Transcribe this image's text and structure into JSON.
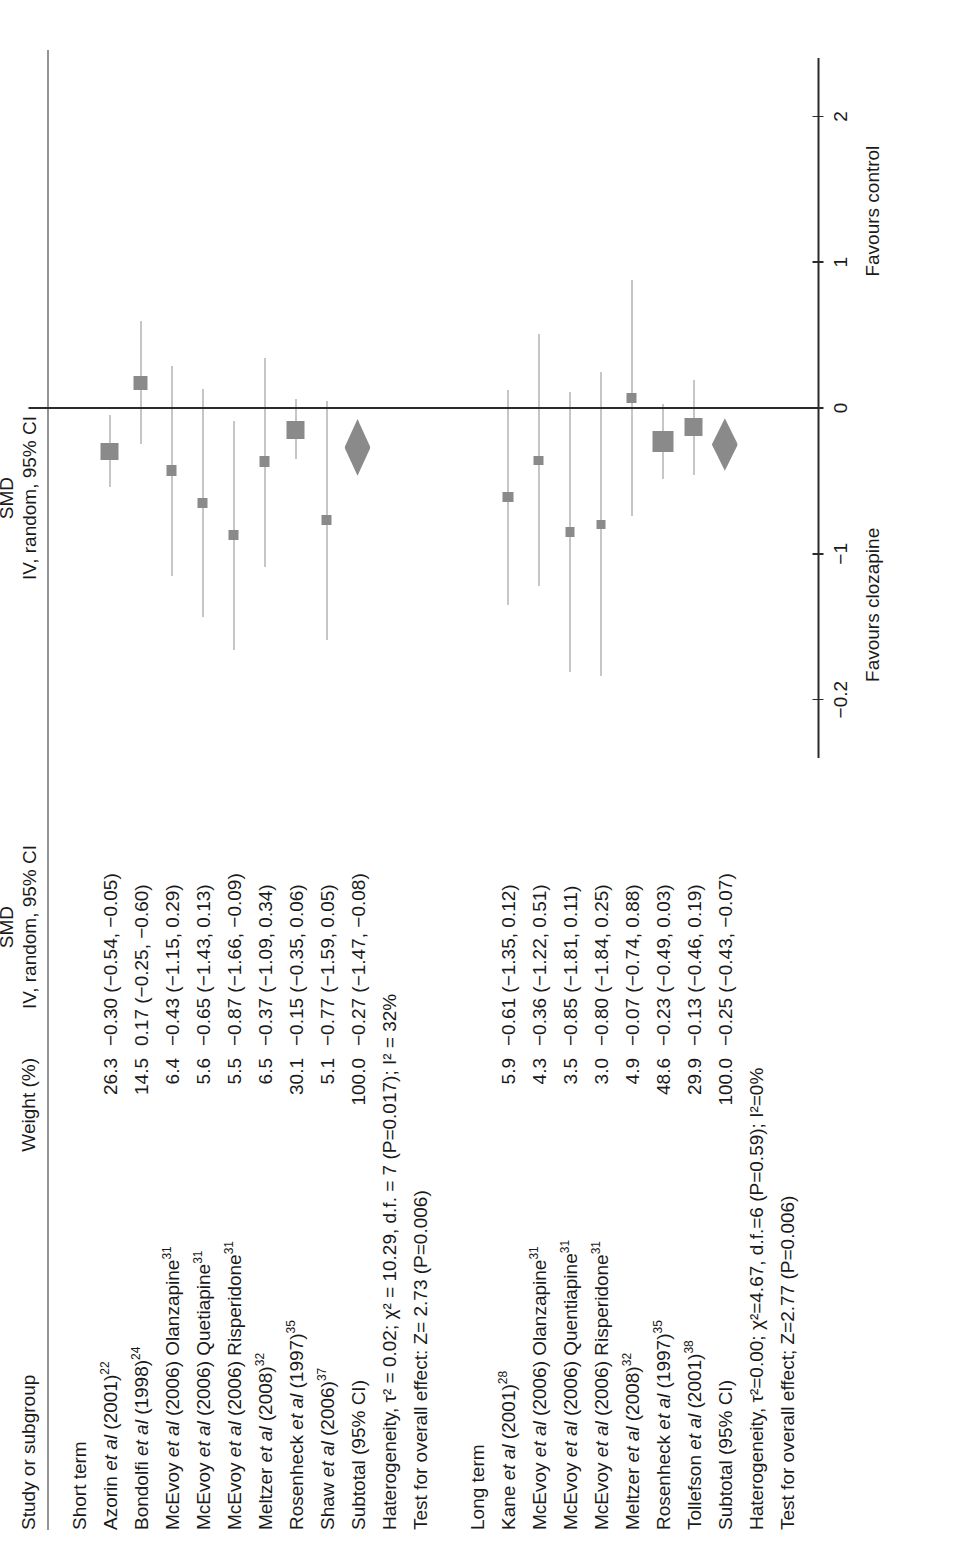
{
  "figure": {
    "columns": {
      "study": "Study or subgroup",
      "weight": "Weight (%)",
      "smd_line1": "SMD",
      "smd_line2": "IV, random, 95% CI",
      "plot_line1": "SMD",
      "plot_line2": "IV, random, 95% CI"
    },
    "axis": {
      "ticks": [
        "-0.2",
        "-1",
        "0",
        "1",
        "2"
      ],
      "tick_values": [
        -2,
        -1,
        0,
        1,
        2
      ],
      "favours_left": "Favours clozapine",
      "favours_right": "Favours control",
      "xmin": -2.4,
      "xmax": 2.4
    },
    "groups": [
      {
        "label": "Short term",
        "rows": [
          {
            "study": "Azorin",
            "study_rest": "et al",
            "year": " (2001)",
            "ref": "22",
            "weight": "26.3",
            "smd": "-0.30 (-0.54, -0.05)",
            "est": -0.3,
            "lo": -0.54,
            "hi": -0.05,
            "wt": 26.3,
            "type": "study"
          },
          {
            "study": "Bondolfi",
            "study_rest": "et al",
            "year": " (1998)",
            "ref": "24",
            "weight": "14.5",
            "smd": "0.17 (-0.25, -0.60)",
            "est": 0.17,
            "lo": -0.25,
            "hi": 0.6,
            "wt": 14.5,
            "type": "study"
          },
          {
            "study": "McEvoy",
            "study_rest": "et al",
            "year": " (2006) Olanzapine",
            "ref": "31",
            "weight": "6.4",
            "smd": "-0.43 (-1.15, 0.29)",
            "est": -0.43,
            "lo": -1.15,
            "hi": 0.29,
            "wt": 6.4,
            "type": "study"
          },
          {
            "study": "McEvoy",
            "study_rest": "et al",
            "year": " (2006) Quetiapine",
            "ref": "31",
            "weight": "5.6",
            "smd": "-0.65 (-1.43, 0.13)",
            "est": -0.65,
            "lo": -1.43,
            "hi": 0.13,
            "wt": 5.6,
            "type": "study"
          },
          {
            "study": "McEvoy",
            "study_rest": "et al",
            "year": " (2006) Risperidone",
            "ref": "31",
            "weight": "5.5",
            "smd": "-0.87 (-1.66, -0.09)",
            "est": -0.87,
            "lo": -1.66,
            "hi": -0.09,
            "wt": 5.5,
            "type": "study"
          },
          {
            "study": "Meltzer",
            "study_rest": "et al",
            "year": " (2008)",
            "ref": "32",
            "weight": "6.5",
            "smd": "-0.37 (-1.09, 0.34)",
            "est": -0.37,
            "lo": -1.09,
            "hi": 0.34,
            "wt": 6.5,
            "type": "study"
          },
          {
            "study": "Rosenheck",
            "study_rest": "et al",
            "year": " (1997)",
            "ref": "35",
            "weight": "30.1",
            "smd": "-0.15 (-0.35, 0.06)",
            "est": -0.15,
            "lo": -0.35,
            "hi": 0.06,
            "wt": 30.1,
            "type": "study"
          },
          {
            "study": "Shaw",
            "study_rest": "et al",
            "year": " (2006)",
            "ref": "37",
            "weight": "5.1",
            "smd": "-0.77 (-1.59, 0.05)",
            "est": -0.77,
            "lo": -1.59,
            "hi": 0.05,
            "wt": 5.1,
            "type": "study"
          },
          {
            "study": "Subtotal (95% CI)",
            "study_rest": "",
            "year": "",
            "ref": "",
            "weight": "100.0",
            "smd": "-0.27 (-1.47, -0.08)",
            "est": -0.27,
            "lo": -0.47,
            "hi": -0.08,
            "wt": 100.0,
            "type": "subtotal"
          }
        ],
        "heterogeneity": "Haterogeneity, τ² = 0.02; χ² = 10.29, d.f. = 7 (P=0.017); I² = 32%",
        "overall_effect": "Test for overall effect: Z= 2.73 (P=0.006)"
      },
      {
        "label": "Long term",
        "rows": [
          {
            "study": "Kane",
            "study_rest": "et al",
            "year": " (2001)",
            "ref": "28",
            "weight": "5.9",
            "smd": "-0.61 (-1.35, 0.12)",
            "est": -0.61,
            "lo": -1.35,
            "hi": 0.12,
            "wt": 5.9,
            "type": "study"
          },
          {
            "study": "McEvoy",
            "study_rest": "et al",
            "year": " (2006) Olanzapine",
            "ref": "31",
            "weight": "4.3",
            "smd": "-0.36 (-1.22, 0.51)",
            "est": -0.36,
            "lo": -1.22,
            "hi": 0.51,
            "wt": 4.3,
            "type": "study"
          },
          {
            "study": "McEvoy",
            "study_rest": "et al",
            "year": " (2006) Quentiapine",
            "ref": "31",
            "weight": "3.5",
            "smd": "-0.85 (-1.81, 0.11)",
            "est": -0.85,
            "lo": -1.81,
            "hi": 0.11,
            "wt": 3.5,
            "type": "study"
          },
          {
            "study": "McEvoy",
            "study_rest": "et al",
            "year": " (2006) Risperidone",
            "ref": "31",
            "weight": "3.0",
            "smd": "-0.80 (-1.84, 0.25)",
            "est": -0.8,
            "lo": -1.84,
            "hi": 0.25,
            "wt": 3.0,
            "type": "study"
          },
          {
            "study": "Meltzer",
            "study_rest": "et al",
            "year": " (2008)",
            "ref": "32",
            "weight": "4.9",
            "smd": "-0.07 (-0.74, 0.88)",
            "est": 0.07,
            "lo": -0.74,
            "hi": 0.88,
            "wt": 4.9,
            "type": "study"
          },
          {
            "study": "Rosenheck",
            "study_rest": "et al",
            "year": " (1997)",
            "ref": "35",
            "weight": "48.6",
            "smd": "-0.23 (-0.49, 0.03)",
            "est": -0.23,
            "lo": -0.49,
            "hi": 0.03,
            "wt": 48.6,
            "type": "study"
          },
          {
            "study": "Tollefson",
            "study_rest": "et al",
            "year": " (2001)",
            "ref": "38",
            "weight": "29.9",
            "smd": "-0.13 (-0.46, 0.19)",
            "est": -0.13,
            "lo": -0.46,
            "hi": 0.19,
            "wt": 29.9,
            "type": "study"
          },
          {
            "study": "Subtotal (95% CI)",
            "study_rest": "",
            "year": "",
            "ref": "",
            "weight": "100.0",
            "smd": "-0.25 (-0.43, -0.07)",
            "est": -0.25,
            "lo": -0.43,
            "hi": -0.07,
            "wt": 100.0,
            "type": "subtotal"
          }
        ],
        "heterogeneity": "Haterogeneity, τ²=0.00; χ²=4.67, d.f.=6 (P=0.59); I²=0%",
        "overall_effect": "Test for overall effect; Z=2.77 (P=0.006)"
      }
    ]
  },
  "chart_data": {
    "type": "forest",
    "title": "",
    "xlabel": "SMD (IV, random, 95% CI)",
    "ylabel": "",
    "xlim": [
      -2.4,
      2.4
    ],
    "xticks": [
      -2,
      -1,
      0,
      1,
      2
    ],
    "xticklabels": [
      "-0.2",
      "-1",
      "0",
      "1",
      "2"
    ],
    "grid": false,
    "null_line": 0,
    "left_label": "Favours clozapine",
    "right_label": "Favours control",
    "effect_measure": "SMD",
    "model": "IV, random, 95% CI",
    "subgroups": [
      {
        "name": "Short term",
        "studies": [
          {
            "label": "Azorin et al (2001)22",
            "weight": 26.3,
            "smd": -0.3,
            "ci_low": -0.54,
            "ci_high": -0.05
          },
          {
            "label": "Bondolfi et al (1998)24",
            "weight": 14.5,
            "smd": 0.17,
            "ci_low": -0.25,
            "ci_high": 0.6
          },
          {
            "label": "McEvoy et al (2006) Olanzapine31",
            "weight": 6.4,
            "smd": -0.43,
            "ci_low": -1.15,
            "ci_high": 0.29
          },
          {
            "label": "McEvoy et al (2006) Quetiapine31",
            "weight": 5.6,
            "smd": -0.65,
            "ci_low": -1.43,
            "ci_high": 0.13
          },
          {
            "label": "McEvoy et al (2006) Risperidone31",
            "weight": 5.5,
            "smd": -0.87,
            "ci_low": -1.66,
            "ci_high": -0.09
          },
          {
            "label": "Meltzer et al (2008)32",
            "weight": 6.5,
            "smd": -0.37,
            "ci_low": -1.09,
            "ci_high": 0.34
          },
          {
            "label": "Rosenheck et al (1997)35",
            "weight": 30.1,
            "smd": -0.15,
            "ci_low": -0.35,
            "ci_high": 0.06
          },
          {
            "label": "Shaw et al (2006)37",
            "weight": 5.1,
            "smd": -0.77,
            "ci_low": -1.59,
            "ci_high": 0.05
          }
        ],
        "subtotal": {
          "label": "Subtotal (95% CI)",
          "weight": 100.0,
          "smd": -0.27,
          "ci_low": -0.47,
          "ci_high": -0.08
        },
        "heterogeneity": {
          "tau2": 0.02,
          "chi2": 10.29,
          "df": 7,
          "p": 0.017,
          "i2": 32
        },
        "overall_effect": {
          "z": 2.73,
          "p": 0.006
        }
      },
      {
        "name": "Long term",
        "studies": [
          {
            "label": "Kane et al (2001)28",
            "weight": 5.9,
            "smd": -0.61,
            "ci_low": -1.35,
            "ci_high": 0.12
          },
          {
            "label": "McEvoy et al (2006) Olanzapine31",
            "weight": 4.3,
            "smd": -0.36,
            "ci_low": -1.22,
            "ci_high": 0.51
          },
          {
            "label": "McEvoy et al (2006) Quentiapine31",
            "weight": 3.5,
            "smd": -0.85,
            "ci_low": -1.81,
            "ci_high": 0.11
          },
          {
            "label": "McEvoy et al (2006) Risperidone31",
            "weight": 3.0,
            "smd": -0.8,
            "ci_low": -1.84,
            "ci_high": 0.25
          },
          {
            "label": "Meltzer et al (2008)32",
            "weight": 4.9,
            "smd": 0.07,
            "ci_low": -0.74,
            "ci_high": 0.88
          },
          {
            "label": "Rosenheck et al (1997)35",
            "weight": 48.6,
            "smd": -0.23,
            "ci_low": -0.49,
            "ci_high": 0.03
          },
          {
            "label": "Tollefson et al (2001)38",
            "weight": 29.9,
            "smd": -0.13,
            "ci_low": -0.46,
            "ci_high": 0.19
          }
        ],
        "subtotal": {
          "label": "Subtotal (95% CI)",
          "weight": 100.0,
          "smd": -0.25,
          "ci_low": -0.43,
          "ci_high": -0.07
        },
        "heterogeneity": {
          "tau2": 0.0,
          "chi2": 4.67,
          "df": 6,
          "p": 0.59,
          "i2": 0
        },
        "overall_effect": {
          "z": 2.77,
          "p": 0.006
        }
      }
    ]
  },
  "colors": {
    "marker": "#8a8a8a",
    "line": "#2b2b2b",
    "ci": "#8e8e8e",
    "text": "#1a1a1a"
  }
}
